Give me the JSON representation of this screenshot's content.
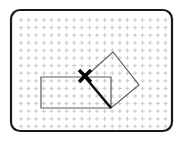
{
  "figure": {
    "title": "",
    "background_color": "#ffffff",
    "width": 184,
    "height": 141
  },
  "frame": {
    "name": "rounded-screen-frame",
    "x": 11,
    "y": 10,
    "width": 161,
    "height": 121,
    "corner_radius": 9,
    "stroke_color": "#1a1a1a",
    "stroke_width": 2.2,
    "fill_color": "#ffffff"
  },
  "grid": {
    "name": "dot-grid",
    "marker": "plus-mark",
    "spacing_x": 7.6,
    "spacing_y": 7.6,
    "origin_x": 21,
    "origin_y": 20,
    "columns": 20,
    "rows": 15,
    "color": "#b9b9b9",
    "mark_size": 2.2
  },
  "shapes": [
    {
      "name": "rectangle",
      "type": "polygon",
      "points": "41,77 111,77 111,108 41,108",
      "stroke_color": "#5c5c5c",
      "stroke_width": 1.2,
      "fill": "none"
    },
    {
      "name": "rotated-square",
      "type": "polygon",
      "points": "85,77 113,52 139,85 111,108",
      "stroke_color": "#5c5c5c",
      "stroke_width": 1.2,
      "fill": "none"
    },
    {
      "name": "highlighted-edge",
      "type": "line",
      "x1": 85,
      "y1": 77,
      "x2": 111,
      "y2": 108,
      "stroke_color": "#111111",
      "stroke_width": 2.6
    }
  ],
  "markers": [
    {
      "name": "x-marker",
      "label": "X",
      "center_x": 85,
      "center_y": 76,
      "arm_length": 6,
      "stroke_color": "#000000",
      "stroke_width": 3.4
    }
  ]
}
